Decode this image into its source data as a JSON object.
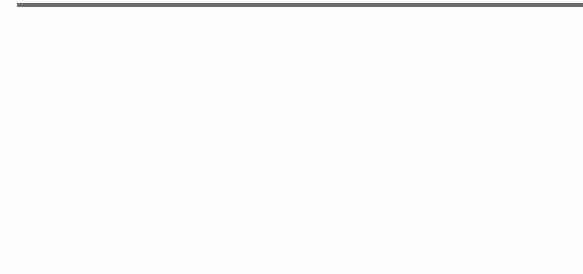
{
  "problem": {
    "number_label": "7.",
    "tens_rods": 8,
    "ones_cubes": 4,
    "cubes_per_rod": 10,
    "represented_value": 84
  },
  "colors": {
    "rule_line": "#6e6e6e",
    "number": "#6a6a6a",
    "block_face": "#b9b9b9",
    "block_side": "#8a8a8a",
    "block_seam": "#555555"
  }
}
